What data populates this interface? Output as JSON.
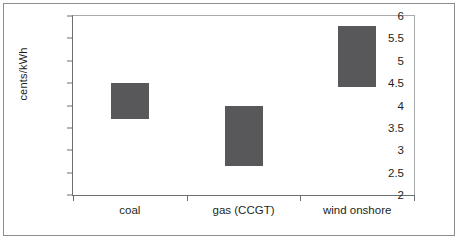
{
  "chart_data": {
    "type": "bar",
    "bar_style": "floating-range",
    "title": "",
    "subtitle": "",
    "xlabel": "",
    "ylabel": "cents/kWh",
    "categories": [
      "coal",
      "gas (CCGT)",
      "wind onshore"
    ],
    "series": [
      {
        "name": "cost range",
        "low": [
          3.7,
          2.65,
          4.42
        ],
        "high": [
          4.5,
          4.0,
          5.78
        ]
      }
    ],
    "values": [
      {
        "category": "coal",
        "low": 3.7,
        "high": 4.5
      },
      {
        "category": "gas (CCGT)",
        "low": 2.65,
        "high": 4.0
      },
      {
        "category": "wind onshore",
        "low": 4.42,
        "high": 5.78
      }
    ],
    "ylim": [
      2,
      6
    ],
    "ytick_step": 0.5,
    "yticks": [
      "6",
      "5.5",
      "5",
      "4.5",
      "4",
      "3.5",
      "3",
      "2.5",
      "2"
    ],
    "ytick_values": [
      6,
      5.5,
      5,
      4.5,
      4,
      3.5,
      3,
      2.5,
      2
    ],
    "grid": false,
    "legend": "none",
    "bar_color": "#58585a",
    "axis_color": "#6d6e70",
    "frame_color": "#8c8c8e",
    "background": "#ffffff"
  }
}
